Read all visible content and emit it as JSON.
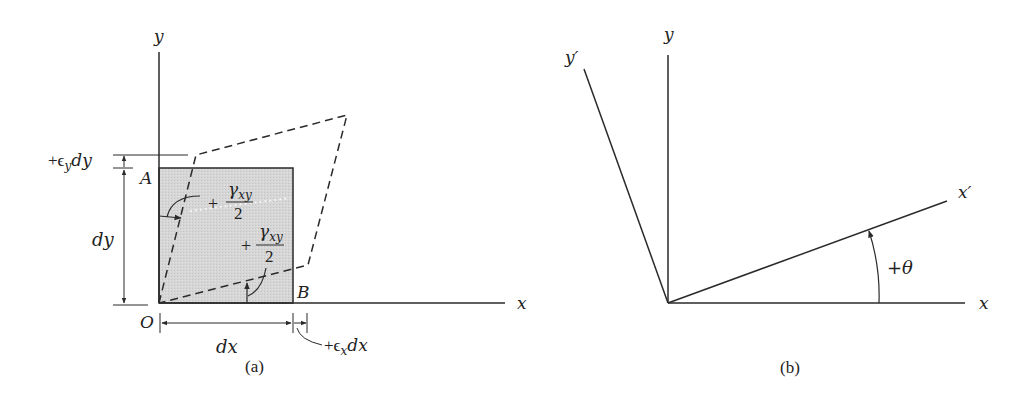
{
  "figure": {
    "panel_a": {
      "caption": "(a)",
      "axis_x": "x",
      "axis_y": "y",
      "point_origin": "O",
      "point_A": "A",
      "point_B": "B",
      "dim_dx": "dx",
      "dim_dy": "dy",
      "strain_x": "+ϵ",
      "strain_x_sub": "x",
      "strain_x_tail": "dx",
      "strain_y": "+ϵ",
      "strain_y_sub": "y",
      "strain_y_tail": "dy",
      "shear_top_sign": "+",
      "shear_top_num": "γ",
      "shear_top_sub": "xy",
      "shear_top_den": "2",
      "shear_bottom_sign": "+",
      "shear_bottom_num": "γ",
      "shear_bottom_sub": "xy",
      "shear_bottom_den": "2",
      "element_fill": "#d4d4d4",
      "line_color": "#2a2a2a"
    },
    "panel_b": {
      "caption": "(b)",
      "axis_x": "x",
      "axis_y": "y",
      "axis_x_prime": "x′",
      "axis_y_prime": "y′",
      "angle_label": "+θ"
    }
  }
}
